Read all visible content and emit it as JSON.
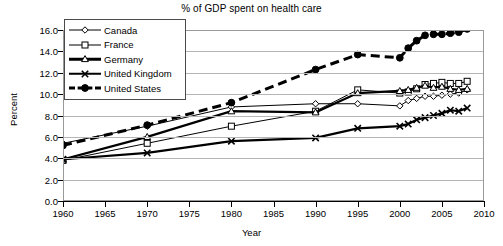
{
  "chart_data": {
    "type": "line",
    "title": "% of GDP spent on health care",
    "xlabel": "Year",
    "ylabel": "Percent",
    "xlim": [
      1960,
      2010
    ],
    "ylim": [
      0.0,
      16.0
    ],
    "xticks": [
      1960,
      1965,
      1970,
      1975,
      1980,
      1985,
      1990,
      1995,
      2000,
      2005,
      2010
    ],
    "yticks": [
      "0.0",
      "2.0",
      "4.0",
      "6.0",
      "8.0",
      "10.0",
      "12.0",
      "14.0",
      "16.0"
    ],
    "grid": "horizontal",
    "legend_position": "top-left",
    "series": [
      {
        "name": "Canada",
        "marker": "open-diamond",
        "line": "solid-thin",
        "x": [
          1960,
          1970,
          1980,
          1990,
          1995,
          2000,
          2001,
          2002,
          2003,
          2004,
          2005,
          2006,
          2007,
          2008
        ],
        "y": [
          5.4,
          7.0,
          8.8,
          9.1,
          9.1,
          8.9,
          9.4,
          9.6,
          9.8,
          9.8,
          9.9,
          10.0,
          10.1,
          10.4
        ]
      },
      {
        "name": "France",
        "marker": "open-square",
        "line": "solid-thin",
        "x": [
          1960,
          1970,
          1980,
          1990,
          1995,
          2000,
          2001,
          2002,
          2003,
          2004,
          2005,
          2006,
          2007,
          2008
        ],
        "y": [
          3.8,
          5.4,
          7.0,
          8.4,
          10.4,
          10.1,
          10.2,
          10.5,
          10.9,
          11.0,
          11.1,
          11.0,
          11.0,
          11.2
        ]
      },
      {
        "name": "Germany",
        "marker": "open-triangle",
        "line": "solid-thick",
        "x": [
          1960,
          1970,
          1980,
          1990,
          1995,
          2000,
          2001,
          2002,
          2003,
          2004,
          2005,
          2006,
          2007,
          2008
        ],
        "y": [
          3.9,
          6.0,
          8.4,
          8.3,
          10.1,
          10.3,
          10.4,
          10.6,
          10.8,
          10.6,
          10.7,
          10.5,
          10.4,
          10.5
        ]
      },
      {
        "name": "United Kingdom",
        "marker": "x-cross",
        "line": "solid-thick",
        "x": [
          1960,
          1970,
          1980,
          1990,
          1995,
          2000,
          2001,
          2002,
          2003,
          2004,
          2005,
          2006,
          2007,
          2008
        ],
        "y": [
          3.9,
          4.5,
          5.6,
          5.9,
          6.8,
          7.0,
          7.2,
          7.6,
          7.8,
          8.0,
          8.2,
          8.5,
          8.4,
          8.7
        ]
      },
      {
        "name": "United States",
        "marker": "filled-circle",
        "line": "dashed-thick",
        "x": [
          1960,
          1970,
          1980,
          1990,
          1995,
          2000,
          2001,
          2002,
          2003,
          2004,
          2005,
          2006,
          2007,
          2008
        ],
        "y": [
          5.2,
          7.1,
          9.2,
          12.3,
          13.7,
          13.4,
          14.3,
          15.0,
          15.5,
          15.6,
          15.6,
          15.7,
          15.8,
          16.1
        ]
      }
    ]
  },
  "legend": {
    "items": [
      {
        "label": "Canada"
      },
      {
        "label": "France"
      },
      {
        "label": "Germany"
      },
      {
        "label": "United Kingdom"
      },
      {
        "label": "United States"
      }
    ]
  }
}
